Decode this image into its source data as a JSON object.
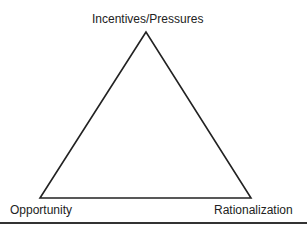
{
  "diagram": {
    "type": "triangle",
    "vertices": {
      "top": "Incentives/Pressures",
      "bottom_left": "Opportunity",
      "bottom_right": "Rationalization"
    },
    "line_color": "#222222"
  }
}
